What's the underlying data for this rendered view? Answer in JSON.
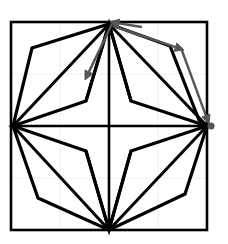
{
  "figure": {
    "canvas": {
      "width": 228,
      "height": 244,
      "background": "#ffffff"
    },
    "colors": {
      "stroke_primary": "#000000",
      "stroke_secondary": "#555555",
      "grid": "#eeeeee",
      "frame": "#000000",
      "marker": "#555555"
    },
    "frame": {
      "label": "bounding-box",
      "x0": 11,
      "y0": 22,
      "x1": 207,
      "y1": 230,
      "stroke_width": 2.6
    },
    "grid": {
      "visible": true,
      "stroke_width": 1,
      "x_ticks": [
        11,
        60,
        109,
        158,
        207
      ],
      "y_ticks": [
        22,
        74,
        126,
        178,
        230
      ]
    },
    "anchors": {
      "top": [
        109,
        24
      ],
      "bottom": [
        109,
        230
      ],
      "left": [
        13,
        126
      ],
      "right": [
        207,
        126
      ],
      "center": [
        109,
        126
      ]
    },
    "outer_polygon": {
      "label": "outer-polygon",
      "stroke_width": 3.2,
      "fill": "none",
      "points": [
        [
          109,
          24
        ],
        [
          170,
          46
        ],
        [
          199,
          120
        ],
        [
          207,
          126
        ],
        [
          185,
          194
        ],
        [
          109,
          230
        ],
        [
          38,
          198
        ],
        [
          13,
          126
        ],
        [
          32,
          48
        ]
      ]
    },
    "inner_star": {
      "label": "inner-star",
      "stroke_width": 3.2,
      "fill": "none",
      "points": [
        [
          109,
          24
        ],
        [
          131,
          101
        ],
        [
          207,
          126
        ],
        [
          131,
          151
        ],
        [
          109,
          230
        ],
        [
          86,
          151
        ],
        [
          13,
          126
        ],
        [
          86,
          101
        ]
      ]
    },
    "axes_lines": [
      {
        "name": "vertical-axis",
        "x1": 109,
        "y1": 24,
        "x2": 109,
        "y2": 230,
        "stroke_width": 2.6
      },
      {
        "name": "horizontal-axis",
        "x1": 13,
        "y1": 126,
        "x2": 207,
        "y2": 126,
        "stroke_width": 2.6
      }
    ],
    "spokes": [
      {
        "name": "spoke-top-left",
        "x1": 109,
        "y1": 24,
        "x2": 13,
        "y2": 126,
        "stroke_width": 3.0
      },
      {
        "name": "spoke-top-right",
        "x1": 109,
        "y1": 24,
        "x2": 207,
        "y2": 126,
        "stroke_width": 3.0
      },
      {
        "name": "spoke-bottom-left",
        "x1": 109,
        "y1": 230,
        "x2": 13,
        "y2": 126,
        "stroke_width": 3.0
      },
      {
        "name": "spoke-bottom-right",
        "x1": 109,
        "y1": 230,
        "x2": 207,
        "y2": 126,
        "stroke_width": 3.0
      },
      {
        "name": "spoke-upper-left-notch",
        "x1": 109,
        "y1": 24,
        "x2": 86,
        "y2": 101,
        "stroke_width": 3.0
      },
      {
        "name": "spoke-upper-right-notch",
        "x1": 109,
        "y1": 24,
        "x2": 131,
        "y2": 101,
        "stroke_width": 3.0
      },
      {
        "name": "spoke-lower-left-notch",
        "x1": 109,
        "y1": 230,
        "x2": 86,
        "y2": 151,
        "stroke_width": 3.0
      },
      {
        "name": "spoke-lower-right-notch",
        "x1": 109,
        "y1": 230,
        "x2": 131,
        "y2": 151,
        "stroke_width": 3.0
      }
    ],
    "arrows": [
      {
        "name": "arrow-down-left",
        "color": "#555555",
        "stroke_width": 2.4,
        "x1": 112,
        "y1": 24,
        "x2": 85,
        "y2": 80,
        "head_size": 9
      },
      {
        "name": "arrow-to-top-vertex",
        "color": "#555555",
        "stroke_width": 2.4,
        "x1": 142,
        "y1": 27,
        "x2": 110,
        "y2": 22,
        "head_size": 9
      },
      {
        "name": "arrow-up-right-edge",
        "color": "#555555",
        "stroke_width": 2.4,
        "x1": 113,
        "y1": 26,
        "x2": 184,
        "y2": 50,
        "head_size": 9
      },
      {
        "name": "arrow-down-right-edge",
        "color": "#555555",
        "stroke_width": 2.4,
        "x1": 181,
        "y1": 48,
        "x2": 209,
        "y2": 124,
        "head_size": 9
      }
    ],
    "markers": [
      {
        "name": "right-vertex-marker",
        "cx": 211,
        "cy": 126,
        "r": 3.6,
        "color": "#555555"
      }
    ]
  }
}
